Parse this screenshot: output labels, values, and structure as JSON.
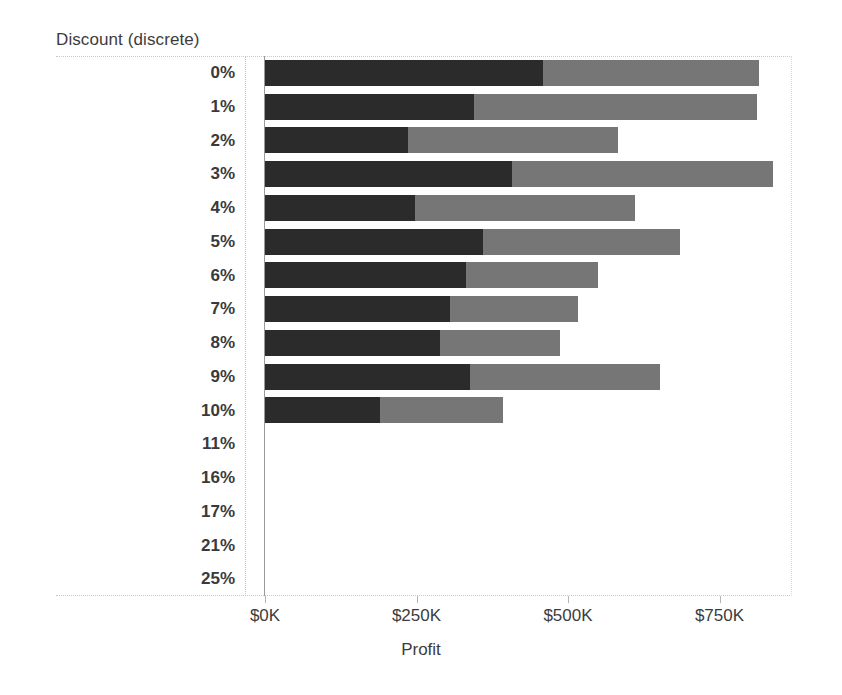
{
  "chart_data": {
    "type": "bar",
    "title": "",
    "subtitle": "",
    "orientation": "horizontal",
    "stacked": true,
    "ylabel": "Discount (discrete)",
    "xlabel": "Profit",
    "grid": false,
    "legend": "none",
    "xlim": [
      0,
      880
    ],
    "xunit": "$K",
    "x_tick_values": [
      0,
      250,
      500,
      750
    ],
    "x_tick_labels": [
      "$0K",
      "$250K",
      "$500K",
      "$750K"
    ],
    "categories": [
      "0%",
      "1%",
      "2%",
      "3%",
      "4%",
      "5%",
      "6%",
      "7%",
      "8%",
      "9%",
      "10%",
      "11%",
      "16%",
      "17%",
      "21%",
      "25%"
    ],
    "series": [
      {
        "name": "segment-dark",
        "color": "#2b2b2b",
        "values": [
          459,
          345,
          236,
          408,
          248,
          360,
          332,
          305,
          289,
          338,
          190,
          0,
          0,
          0,
          0,
          0
        ]
      },
      {
        "name": "segment-light",
        "color": "#767676",
        "values": [
          357,
          467,
          347,
          431,
          363,
          324,
          218,
          212,
          198,
          314,
          203,
          0,
          0,
          0,
          0,
          0
        ]
      }
    ],
    "totals": [
      816,
      812,
      583,
      839,
      611,
      684,
      550,
      517,
      487,
      652,
      393,
      0,
      0,
      0,
      0,
      0
    ]
  },
  "axes": {
    "y_caption": "Discount (discrete)",
    "x_title": "Profit"
  },
  "colors": {
    "segment_dark": "#2b2b2b",
    "segment_light": "#767676",
    "axis_line": "#9a9a9a",
    "frame": "#c8c8c8",
    "text": "#3c3c3c",
    "background": "#ffffff"
  }
}
